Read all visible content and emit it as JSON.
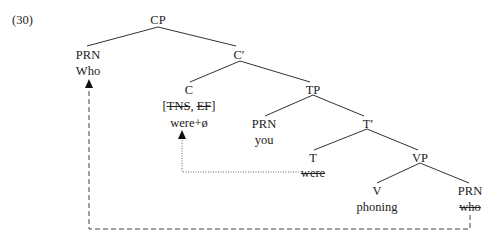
{
  "example_number": "(30)",
  "tree": {
    "cp": "CP",
    "spec_cp_label": "PRN",
    "spec_cp_word": "Who",
    "c_bar": "C′",
    "c": "C",
    "c_features_open": "[",
    "c_feature_tns": "TNS",
    "c_features_sep": ", ",
    "c_feature_ef": "EF",
    "c_features_close": "]",
    "c_word": "were+ø",
    "tp": "TP",
    "spec_tp_label": "PRN",
    "spec_tp_word": "you",
    "t_bar": "T′",
    "t": "T",
    "t_word": "were",
    "vp": "VP",
    "v": "V",
    "v_word": "phoning",
    "obj_label": "PRN",
    "obj_word": "who"
  },
  "movements": [
    {
      "type": "dashed",
      "from": "who",
      "to": "Who"
    },
    {
      "type": "dotted",
      "from": "were",
      "to": "were+ø"
    }
  ]
}
